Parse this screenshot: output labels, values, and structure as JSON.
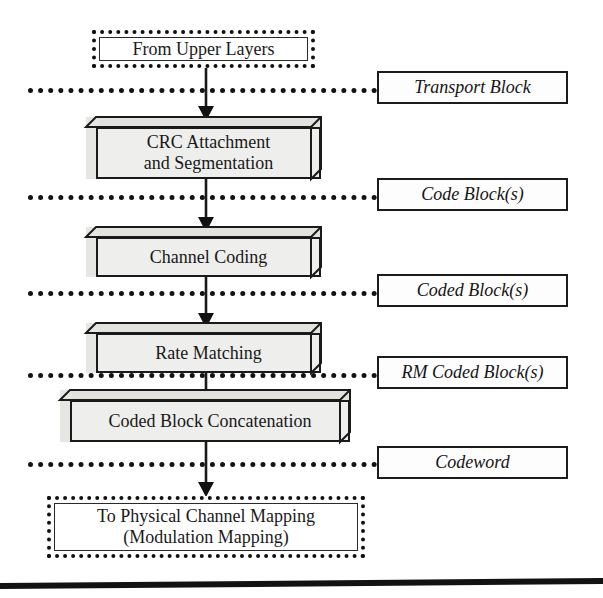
{
  "diagram": {
    "colors": {
      "stroke": "#1a1a1a",
      "block_fill": "#eeeeec",
      "block_top": "#e2e2de",
      "block_side": "#e6e6e2",
      "background": "#ffffff"
    },
    "terminals": [
      {
        "id": "from-upper-layers",
        "label": "From Upper Layers",
        "border": "dotted"
      },
      {
        "id": "to-physical-channel-mapping",
        "label_line_1": "To Physical Channel Mapping",
        "label_line_2": "(Modulation Mapping)",
        "border": "dotted"
      }
    ],
    "process_blocks": [
      {
        "id": "crc-attachment-and-segmentation",
        "label_line_1": "CRC Attachment",
        "label_line_2": "and Segmentation"
      },
      {
        "id": "channel-coding",
        "label_line_1": "Channel Coding",
        "label_line_2": ""
      },
      {
        "id": "rate-matching",
        "label_line_1": "Rate Matching",
        "label_line_2": ""
      },
      {
        "id": "coded-block-concatenation",
        "label_line_1": "Coded Block Concatenation",
        "label_line_2": ""
      }
    ],
    "data_labels": [
      {
        "id": "transport-block",
        "label": "Transport Block"
      },
      {
        "id": "code-blocks",
        "label": "Code Block(s)"
      },
      {
        "id": "coded-blocks",
        "label": "Coded Block(s)"
      },
      {
        "id": "rm-coded-blocks",
        "label": "RM Coded Block(s)"
      },
      {
        "id": "codeword",
        "label": "Codeword"
      }
    ]
  }
}
